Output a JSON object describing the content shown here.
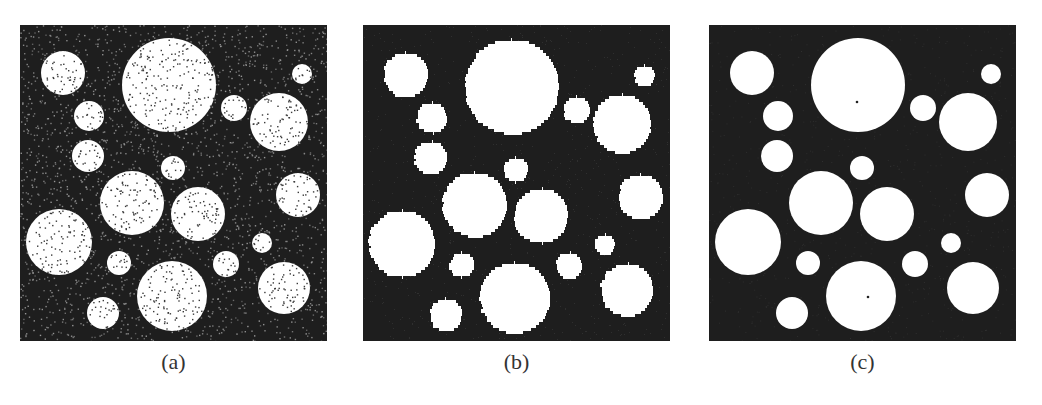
{
  "figure": {
    "panels": [
      {
        "id": "a",
        "caption": "(a)",
        "description": "noisy binary image of circles (salt-and-pepper noise)",
        "left": 20,
        "noise": true,
        "center_dots": false
      },
      {
        "id": "b",
        "caption": "(b)",
        "description": "denoised segmentation result with jagged circle edges",
        "left": 363,
        "noise": false,
        "center_dots": false
      },
      {
        "id": "c",
        "caption": "(c)",
        "description": "denoised segmentation result with smooth circle edges",
        "left": 709,
        "noise": false,
        "center_dots": true
      }
    ],
    "colors": {
      "background": "#1e1e1e",
      "foreground": "#ffffff",
      "noise_light": "#9a9a9a",
      "noise_dark": "#3a3a3a",
      "caption": "#333333"
    },
    "panel_size": {
      "width": 307,
      "height": 316
    },
    "circles": [
      {
        "cx": 43,
        "cy": 48,
        "r": 22
      },
      {
        "cx": 149,
        "cy": 60,
        "r": 47
      },
      {
        "cx": 282,
        "cy": 49,
        "r": 10
      },
      {
        "cx": 69,
        "cy": 91,
        "r": 15
      },
      {
        "cx": 214,
        "cy": 83,
        "r": 13
      },
      {
        "cx": 259,
        "cy": 97,
        "r": 29
      },
      {
        "cx": 68,
        "cy": 131,
        "r": 16
      },
      {
        "cx": 153,
        "cy": 143,
        "r": 12
      },
      {
        "cx": 112,
        "cy": 178,
        "r": 32
      },
      {
        "cx": 178,
        "cy": 189,
        "r": 27
      },
      {
        "cx": 278,
        "cy": 170,
        "r": 22
      },
      {
        "cx": 39,
        "cy": 217,
        "r": 33
      },
      {
        "cx": 242,
        "cy": 218,
        "r": 10
      },
      {
        "cx": 99,
        "cy": 238,
        "r": 12
      },
      {
        "cx": 206,
        "cy": 239,
        "r": 13
      },
      {
        "cx": 264,
        "cy": 263,
        "r": 26
      },
      {
        "cx": 152,
        "cy": 271,
        "r": 35
      },
      {
        "cx": 83,
        "cy": 288,
        "r": 16
      }
    ],
    "center_dots": [
      {
        "cx": 148,
        "cy": 77
      },
      {
        "cx": 159,
        "cy": 272
      }
    ]
  }
}
